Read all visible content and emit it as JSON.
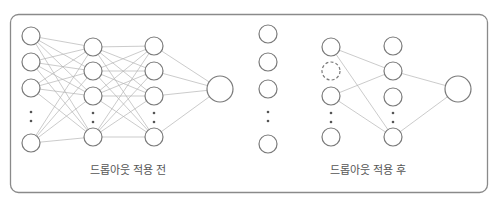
{
  "diagram": {
    "colors": {
      "frame": "#8a8a8a",
      "node_stroke": "#7a7a7a",
      "edge": "#b4b4b4",
      "text": "#555555",
      "background": "#ffffff"
    },
    "frame": {
      "x": 10.5,
      "y": 14.5,
      "width": 477,
      "height": 178,
      "radius": 8
    },
    "panels": [
      {
        "id": "before",
        "caption": "드롭아웃 적용 전",
        "caption_pos": {
          "x": 128,
          "y": 174
        },
        "layers": [
          {
            "name": "input",
            "x": 31,
            "r": 9,
            "nodes": [
              36,
              62,
              88,
              143
            ],
            "dots": [
              112,
              121
            ],
            "dropped": []
          },
          {
            "name": "hidden1",
            "x": 93,
            "r": 9,
            "nodes": [
              47,
              71,
              96,
              137
            ],
            "dots": [
              113,
              122
            ],
            "dropped": []
          },
          {
            "name": "hidden2",
            "x": 154,
            "r": 9,
            "nodes": [
              46,
              71,
              96,
              137
            ],
            "dots": [
              113,
              122
            ],
            "dropped": []
          },
          {
            "name": "output",
            "x": 220,
            "r": 13,
            "nodes": [
              89
            ],
            "dots": [],
            "dropped": []
          }
        ],
        "connections": "full"
      },
      {
        "id": "after",
        "caption": "드롭아웃 적용 후",
        "caption_pos": {
          "x": 368,
          "y": 174
        },
        "layers": [
          {
            "name": "input",
            "x": 268,
            "r": 9,
            "nodes": [
              34,
              62,
              89,
              144
            ],
            "dots": [
              112,
              121
            ],
            "dropped": []
          },
          {
            "name": "hidden1",
            "x": 331,
            "r": 9,
            "nodes": [
              47,
              71,
              96,
              137
            ],
            "dots": [
              113,
              122
            ],
            "dropped": [
              1
            ]
          },
          {
            "name": "hidden2",
            "x": 393,
            "r": 9,
            "nodes": [
              46,
              71,
              97,
              137
            ],
            "dots": [
              113,
              122
            ],
            "dropped": []
          },
          {
            "name": "output",
            "x": 458,
            "r": 13,
            "nodes": [
              89
            ],
            "dots": [],
            "dropped": []
          }
        ],
        "connections": [
          {
            "from": [
              1,
              0
            ],
            "to": [
              2,
              1
            ]
          },
          {
            "from": [
              1,
              0
            ],
            "to": [
              2,
              3
            ]
          },
          {
            "from": [
              1,
              2
            ],
            "to": [
              2,
              1
            ]
          },
          {
            "from": [
              1,
              2
            ],
            "to": [
              2,
              3
            ]
          },
          {
            "from": [
              2,
              1
            ],
            "to": [
              3,
              0
            ]
          },
          {
            "from": [
              2,
              3
            ],
            "to": [
              3,
              0
            ]
          }
        ]
      }
    ]
  }
}
